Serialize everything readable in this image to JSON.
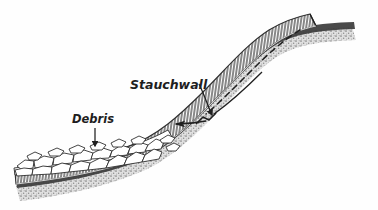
{
  "figure": {
    "type": "geological-cross-section",
    "background_color": "#fefefe",
    "ink_color": "#1c1c1c",
    "labels": {
      "stauchwall": "Stauchwall",
      "debris": "Debris"
    },
    "annotations": [
      {
        "name": "stauchwall",
        "text": "Stauchwall",
        "text_position": [
          130,
          85
        ],
        "leader_from": [
          198,
          82
        ],
        "leader_to": [
          212,
          117
        ],
        "arrowhead": "down-right"
      },
      {
        "name": "debris",
        "text": "Debris",
        "text_position": [
          72,
          120
        ],
        "leader_from": [
          95,
          124
        ],
        "leader_to": [
          95,
          148
        ],
        "arrowhead": "down"
      }
    ],
    "movement_arrow": {
      "name": "downslope-movement-arrow",
      "from": [
        205,
        120
      ],
      "to": [
        172,
        124
      ],
      "direction": "left-downslope"
    },
    "former_surface_line": {
      "name": "former-surface-dashed-line",
      "style": "dashed",
      "description": "dashed line marking original pre-failure slab position"
    },
    "layers": [
      {
        "name": "debris-blocks",
        "label": "Debris",
        "texture": "angular-rubble-polygons",
        "fill": "#ffffff",
        "stroke": "#222222"
      },
      {
        "name": "hatched-slab",
        "texture": "vertical-hatching",
        "fill": "#ffffff",
        "stroke": "#2a2a2a"
      },
      {
        "name": "dark-basal-band",
        "texture": "solid-dark",
        "fill": "#3a3a3a"
      },
      {
        "name": "stippled-substrate",
        "texture": "stipple-shading",
        "fill": "#8d8d8d"
      }
    ]
  }
}
